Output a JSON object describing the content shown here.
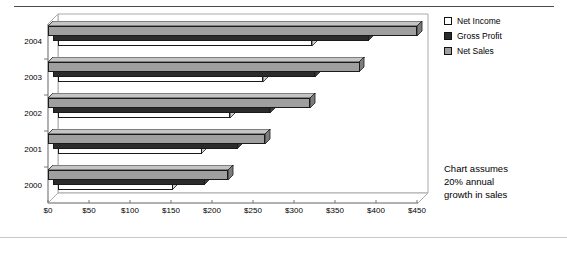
{
  "chart_data": {
    "type": "bar",
    "orientation": "horizontal",
    "style": "3d-clustered-bar",
    "title": "",
    "subtitle": "",
    "xlabel": "",
    "ylabel": "",
    "categories": [
      "2000",
      "2001",
      "2002",
      "2003",
      "2004"
    ],
    "category_order_top_to_bottom": [
      "2004",
      "2003",
      "2002",
      "2001",
      "2000"
    ],
    "series": [
      {
        "name": "Net Income",
        "color": "#ffffff",
        "values": [
          140,
          175,
          210,
          250,
          310
        ]
      },
      {
        "name": "Gross Profit",
        "color": "#2b2b2b",
        "values": [
          185,
          225,
          265,
          320,
          385
        ]
      },
      {
        "name": "Net Sales",
        "color": "#9f9f9f",
        "values": [
          220,
          265,
          320,
          380,
          450
        ]
      }
    ],
    "xlim": [
      0,
      450
    ],
    "xtick_values": [
      0,
      50,
      100,
      150,
      200,
      250,
      300,
      350,
      400,
      450
    ],
    "xtick_labels": [
      "$0",
      "$50",
      "$100",
      "$150",
      "$200",
      "$250",
      "$300",
      "$350",
      "$400",
      "$450"
    ],
    "grid": false,
    "legend_position": "right-top",
    "annotations": [
      {
        "name": "growth-assumption-note",
        "lines": [
          "Chart assumes",
          "20% annual",
          "growth in sales"
        ],
        "text": "Chart assumes 20% annual growth in sales",
        "position": "right-bottom"
      }
    ]
  },
  "legend": {
    "items": [
      {
        "label": "Net Income",
        "swatch": "#ffffff"
      },
      {
        "label": "Gross Profit",
        "swatch": "#2b2b2b"
      },
      {
        "label": "Net Sales",
        "swatch": "#9f9f9f"
      }
    ]
  },
  "note": {
    "line1": "Chart assumes",
    "line2": "20% annual",
    "line3": "growth in sales"
  },
  "axis": {
    "y_labels": [
      "2004",
      "2003",
      "2002",
      "2001",
      "2000"
    ],
    "x_labels": [
      "$0",
      "$50",
      "$100",
      "$150",
      "$200",
      "$250",
      "$300",
      "$350",
      "$400",
      "$450"
    ]
  },
  "colors": {
    "net_income": "#ffffff",
    "gross_profit": "#2b2b2b",
    "net_sales": "#9f9f9f",
    "axis_line": "#9a9a9a",
    "rule_top": "#4a4a4a",
    "rule_bottom": "#c9c9c9"
  }
}
